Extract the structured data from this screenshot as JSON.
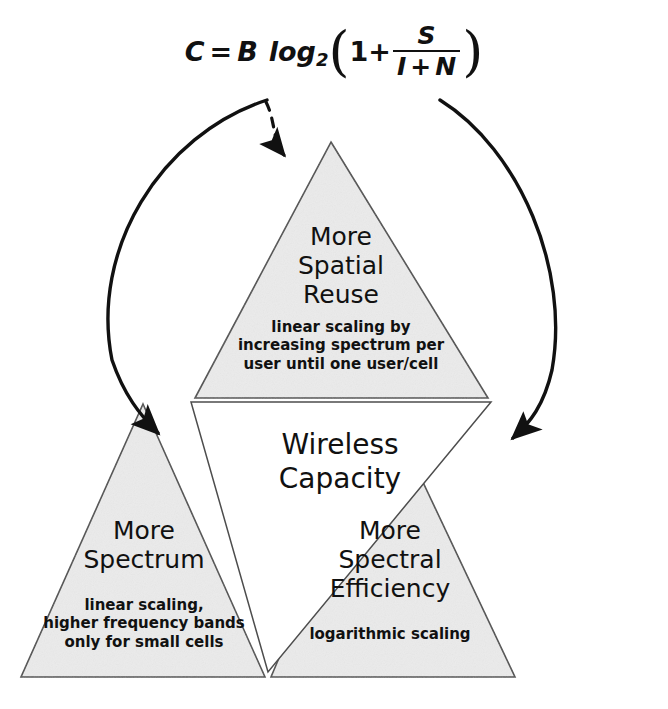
{
  "diagram": {
    "title": "Wireless Capacity",
    "formula": {
      "lhs": "C",
      "equals": "=",
      "bandwidth": "B",
      "log": "log",
      "log_base": "2",
      "open_paren": "(",
      "one": "1",
      "plus": "+",
      "numerator": "S",
      "denominator_left": "I",
      "denominator_plus": "+",
      "denominator_right": "N",
      "close_paren": ")",
      "plain": "C = B log2(1 + S/(I + N))"
    },
    "center": {
      "line1": "Wireless",
      "line2": "Capacity"
    },
    "triangles": [
      {
        "id": "spatial-reuse",
        "title_line1": "More",
        "title_line2": "Spatial",
        "title_line3": "Reuse",
        "sub_line1": "linear scaling by",
        "sub_line2": "increasing spectrum per",
        "sub_line3": "user until one user/cell",
        "fill": "#ebebeb",
        "stroke": "#4d4d4d"
      },
      {
        "id": "more-spectrum",
        "title_line1": "More",
        "title_line2": "Spectrum",
        "title_line3": "",
        "sub_line1": "linear scaling,",
        "sub_line2": "higher frequency bands",
        "sub_line3": "only for small cells",
        "fill": "#ebebeb",
        "stroke": "#4d4d4d"
      },
      {
        "id": "spectral-efficiency",
        "title_line1": "More",
        "title_line2": "Spectral",
        "title_line3": "Efficiency",
        "sub_line1": "logarithmic scaling",
        "sub_line2": "",
        "sub_line3": "",
        "fill": "#ebebeb",
        "stroke": "#4d4d4d"
      }
    ],
    "arrows": [
      {
        "id": "arrow-bandwidth-to-spectrum",
        "style": "solid",
        "from": "B (bandwidth term)",
        "to": "More Spectrum"
      },
      {
        "id": "arrow-interference-to-spatial-reuse",
        "style": "dashed",
        "from": "I (interference term)",
        "to": "More Spatial Reuse"
      },
      {
        "id": "arrow-sinr-to-spectral-efficiency",
        "style": "solid",
        "from": "S/(I+N) (SINR term)",
        "to": "More Spectral Efficiency"
      }
    ],
    "colors": {
      "background": "#ffffff",
      "triangle_fill": "#ebebeb",
      "triangle_stroke": "#4d4d4d",
      "arrow": "#111111",
      "text": "#111111"
    }
  }
}
